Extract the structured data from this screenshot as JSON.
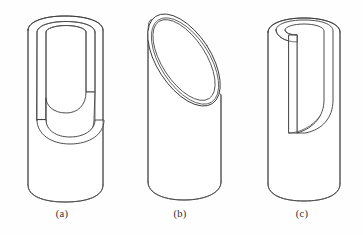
{
  "figure": {
    "type": "technical-line-drawing",
    "background_color": "#fefefe",
    "line_color": "#3a3a3a",
    "panels": [
      {
        "id": "a",
        "caption": "(a)",
        "shape_name": "cylinder-with-u-slot",
        "description": "Upright hollow cylinder with a wide U-shaped slot cut downward from the top rim, exposing the inner wall thickness"
      },
      {
        "id": "b",
        "caption": "(b)",
        "shape_name": "cylinder-with-oblique-cut",
        "description": "Upright hollow cylinder cut by an inclined plane producing a tilted elliptical opening with visible wall thickness"
      },
      {
        "id": "c",
        "caption": "(c)",
        "shape_name": "cylinder-with-d-shaped-cut",
        "description": "Upright hollow cylinder with a D-shaped crescent cut: a straight vertical edge and a curved outer edge"
      }
    ]
  },
  "captions": {
    "a": "(a)",
    "b": "(b)",
    "c": "(c)"
  }
}
